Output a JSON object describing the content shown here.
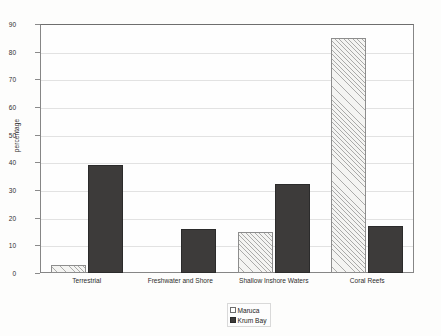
{
  "chart_data": {
    "type": "bar",
    "title": "",
    "xlabel": "",
    "ylabel": "percentage",
    "ylim": [
      0,
      90
    ],
    "ytick_step": 10,
    "yticks": [
      90,
      80,
      70,
      60,
      50,
      40,
      30,
      20,
      10,
      0
    ],
    "grid": true,
    "legend_position": "bottom-center",
    "categories": [
      "Terrestrial",
      "Freshwater and Shore",
      "Shallow Inshore Waters",
      "Coral Reefs"
    ],
    "series": [
      {
        "name": "Maruca",
        "style": "hatched",
        "color": "#f4f4f2",
        "values": [
          3,
          0,
          15,
          85
        ]
      },
      {
        "name": "Krum Bay",
        "style": "solid",
        "color": "#3d3b3a",
        "values": [
          39,
          16,
          32,
          17
        ]
      }
    ]
  },
  "legend": {
    "items": [
      {
        "label": "Maruca",
        "swatch": "hatched-square-icon"
      },
      {
        "label": "Krum Bay",
        "swatch": "filled-square-icon"
      }
    ]
  }
}
